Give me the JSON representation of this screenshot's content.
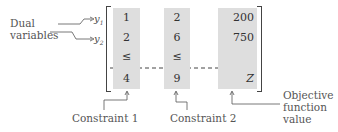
{
  "left_labels": {
    "title_line1": "Dual",
    "title_line2": "variables",
    "y1": "y",
    "y1_sub": "1",
    "y2": "y",
    "y2_sub": "2"
  },
  "matrix": {
    "columns": [
      {
        "name": "constraint-1",
        "values": [
          "1",
          "2",
          "≤",
          "4"
        ]
      },
      {
        "name": "constraint-2",
        "values": [
          "2",
          "6",
          "≤",
          "9"
        ]
      },
      {
        "name": "objective",
        "values": [
          "200",
          "750",
          "",
          "Z"
        ]
      }
    ]
  },
  "annotations": {
    "constraint1": "Constraint 1",
    "constraint2": "Constraint 2",
    "objective_line1": "Objective",
    "objective_line2": "function",
    "objective_line3": "value"
  },
  "colors": {
    "column_fill": "#dedede",
    "line": "#444444"
  }
}
